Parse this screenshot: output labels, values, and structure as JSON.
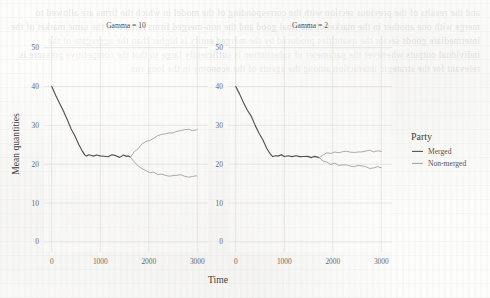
{
  "chart_data": {
    "type": "line",
    "title": "",
    "xlabel": "Time",
    "ylabel": "Mean quantities",
    "xlim": [
      -160,
      3220
    ],
    "ylim": [
      -2.6,
      53
    ],
    "xticks": [
      0,
      1000,
      2000,
      3000
    ],
    "yticks": [
      0,
      10,
      20,
      30,
      40,
      50
    ],
    "grid": true,
    "legend": {
      "title": "Party",
      "position": "right",
      "entries": [
        {
          "label": "Merged",
          "color": "#55534e"
        },
        {
          "label": "Non-merged",
          "color": "#a9a6a0"
        }
      ]
    },
    "facets": [
      {
        "title": "Gamma = 10",
        "series": [
          {
            "name": "Merged",
            "color": "#55534e",
            "x": [
              0,
              80,
              160,
              240,
              320,
              400,
              480,
              560,
              620,
              680,
              720,
              760,
              800,
              860,
              920,
              1000,
              1080,
              1160,
              1240,
              1320,
              1400,
              1480,
              1540,
              1580,
              1620
            ],
            "y": [
              40.0,
              38.0,
              35.9,
              33.7,
              31.5,
              29.3,
              27.1,
              24.9,
              23.4,
              22.6,
              22.3,
              22.2,
              22.3,
              22.1,
              22.3,
              22.1,
              22.2,
              22.0,
              22.2,
              22.1,
              22.0,
              22.1,
              22.0,
              21.9,
              21.8
            ]
          },
          {
            "name": "Non-merged-upper",
            "color": "#a9a6a0",
            "x": [
              1620,
              1700,
              1780,
              1860,
              1940,
              2020,
              2100,
              2180,
              2260,
              2340,
              2420,
              2500,
              2580,
              2660,
              2740,
              2820,
              2900,
              2980,
              3000
            ],
            "y": [
              21.8,
              23.1,
              24.2,
              25.1,
              25.8,
              26.4,
              26.8,
              27.2,
              27.5,
              27.8,
              28.0,
              28.2,
              28.4,
              28.6,
              28.7,
              28.8,
              28.9,
              29.0,
              29.0
            ]
          },
          {
            "name": "Non-merged-lower",
            "color": "#a9a6a0",
            "x": [
              1620,
              1700,
              1780,
              1860,
              1940,
              2020,
              2100,
              2180,
              2260,
              2340,
              2420,
              2500,
              2580,
              2660,
              2740,
              2820,
              2900,
              2980,
              3000
            ],
            "y": [
              21.8,
              20.6,
              19.6,
              18.9,
              18.4,
              18.0,
              17.7,
              17.5,
              17.4,
              17.3,
              17.2,
              17.1,
              17.0,
              17.0,
              16.9,
              16.9,
              16.8,
              16.8,
              16.8
            ]
          }
        ]
      },
      {
        "title": "Gamma = 2",
        "series": [
          {
            "name": "Merged",
            "color": "#55534e",
            "x": [
              0,
              80,
              160,
              240,
              320,
              400,
              480,
              560,
              640,
              700,
              760,
              820,
              880,
              940,
              1000,
              1080,
              1160,
              1240,
              1320,
              1400,
              1480,
              1560,
              1620,
              1680,
              1720
            ],
            "y": [
              40.0,
              38.1,
              36.1,
              34.1,
              32.1,
              30.1,
              28.1,
              26.1,
              24.1,
              22.9,
              22.2,
              22.0,
              22.2,
              22.3,
              22.1,
              22.2,
              22.0,
              22.1,
              22.0,
              21.9,
              21.9,
              21.8,
              21.8,
              21.7,
              21.7
            ]
          },
          {
            "name": "Non-merged-upper",
            "color": "#a9a6a0",
            "x": [
              1720,
              1800,
              1880,
              1960,
              2040,
              2120,
              2200,
              2280,
              2360,
              2440,
              2520,
              2600,
              2680,
              2760,
              2840,
              2920,
              3000
            ],
            "y": [
              21.7,
              22.3,
              22.7,
              22.9,
              23.0,
              23.1,
              23.0,
              23.2,
              23.1,
              23.2,
              23.1,
              23.2,
              23.2,
              23.3,
              23.2,
              23.3,
              23.3
            ]
          },
          {
            "name": "Non-merged-lower",
            "color": "#a9a6a0",
            "x": [
              1720,
              1800,
              1880,
              1960,
              2040,
              2120,
              2200,
              2280,
              2360,
              2440,
              2520,
              2600,
              2680,
              2760,
              2840,
              2920,
              3000
            ],
            "y": [
              21.7,
              21.0,
              20.5,
              20.2,
              20.0,
              19.8,
              19.7,
              19.6,
              19.5,
              19.4,
              19.4,
              19.3,
              19.3,
              19.2,
              19.2,
              19.1,
              19.1
            ]
          }
        ]
      }
    ]
  },
  "bleed_text": "and the results of the previous section with the corresponding of the model in which the firms are allowed to merge with one another in the market of the final good and the non-merged firms remain in the same market of the intermediate goods sector the quantities produced by the merged entity is higher than the aggregate of the individual outputs whenever the parameter of substitution is sufficiently large so that the competitive pressure is relevant for the strategic interaction among the agents of the economy in the long run"
}
